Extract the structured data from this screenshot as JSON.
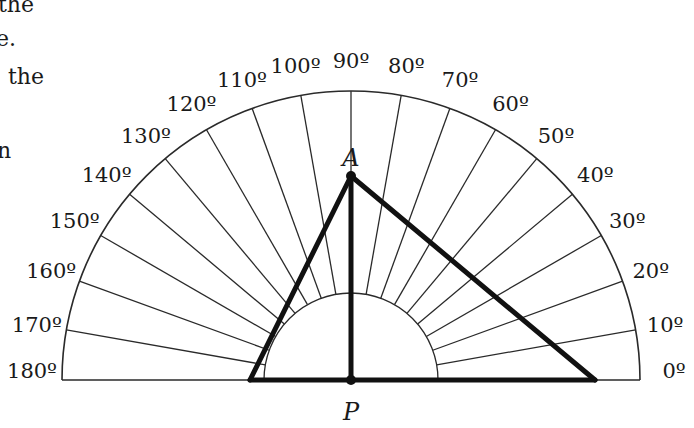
{
  "cropped_text": [
    "the",
    "e.",
    "the",
    "n"
  ],
  "protractor": {
    "center": {
      "x": 351,
      "y": 380
    },
    "outer_radius": 289,
    "inner_radius": 87,
    "tick_step_deg": 10,
    "labels": [
      "0º",
      "10º",
      "20º",
      "30º",
      "40º",
      "50º",
      "60º",
      "70º",
      "80º",
      "90º",
      "100º",
      "110º",
      "120º",
      "130º",
      "140º",
      "150º",
      "160º",
      "170º",
      "180º"
    ]
  },
  "triangle": {
    "apex_label": "A",
    "foot_label": "P",
    "apex": {
      "x": 351,
      "y": 176
    },
    "left_base": {
      "x": 250,
      "y": 380
    },
    "right_base": {
      "x": 595,
      "y": 380
    },
    "foot": {
      "x": 351,
      "y": 380
    }
  },
  "colors": {
    "ink": "#1a1a1a",
    "background": "#ffffff"
  }
}
